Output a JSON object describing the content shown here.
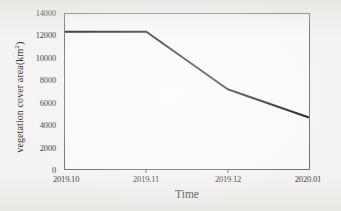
{
  "chart_data": {
    "type": "line",
    "title": "",
    "xlabel": "Time",
    "ylabel": "vegetation cover area(km2)",
    "ylabel_base": "vegetation cover area(km",
    "ylabel_sup": "2",
    "ylabel_tail": ")",
    "categories": [
      "2019.10",
      "2019.11",
      "2019.12",
      "2020.01"
    ],
    "values": [
      12400,
      12400,
      7200,
      4650
    ],
    "series": [
      {
        "name": "vegetation cover area",
        "values": [
          12400,
          12400,
          7200,
          4650
        ]
      }
    ],
    "ylim": [
      0,
      14000
    ],
    "yticks": [
      0,
      2000,
      4000,
      6000,
      8000,
      10000,
      12000,
      14000
    ],
    "ytick_labels": [
      "0",
      "2000",
      "4000",
      "6000",
      "8000",
      "10000",
      "12000",
      "14000"
    ],
    "grid": false,
    "legend": false,
    "legend_position": "none",
    "line_color": "#1a1a1a",
    "line_width": 2,
    "frame_color": "#6f6f6f",
    "background_color": "#f4f3f1",
    "plot_background_color": "#fbfafa"
  }
}
